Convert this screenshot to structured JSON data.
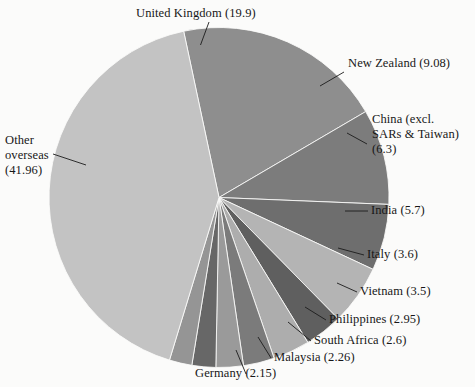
{
  "chart_data": {
    "type": "pie",
    "title": "",
    "subtitle": "",
    "xlabel": "",
    "ylabel": "",
    "legend_position": "callout-labels",
    "grid": false,
    "units": "percent",
    "total": 100.0,
    "start_angle_deg": -12,
    "direction": "clockwise",
    "categories": [
      "United Kingdom",
      "New Zealand",
      "China (excl. SARs & Taiwan)",
      "India",
      "Italy",
      "Vietnam",
      "Philippines",
      "South Africa",
      "Malaysia",
      "Germany",
      "Other overseas"
    ],
    "values": [
      19.9,
      9.08,
      6.3,
      5.7,
      3.6,
      3.5,
      2.95,
      2.6,
      2.26,
      2.15,
      41.96
    ],
    "colors": [
      "#8e8e8e",
      "#7c7c7c",
      "#6e6e6e",
      "#b4b4b4",
      "#5f5f5f",
      "#adadad",
      "#7b7b7b",
      "#9a9a9a",
      "#676767",
      "#959595",
      "#c3c3c3"
    ],
    "slices": [
      {
        "label": "United Kingdom",
        "value": 19.9,
        "display": "United Kingdom (19.9)",
        "color": "#8e8e8e"
      },
      {
        "label": "New Zealand",
        "value": 9.08,
        "display": "New Zealand (9.08)",
        "color": "#7c7c7c"
      },
      {
        "label": "China (excl. SARs & Taiwan)",
        "value": 6.3,
        "display": "China (excl. SARs & Taiwan) (6.3)",
        "color": "#6e6e6e"
      },
      {
        "label": "India",
        "value": 5.7,
        "display": "India (5.7)",
        "color": "#b4b4b4"
      },
      {
        "label": "Italy",
        "value": 3.6,
        "display": "Italy (3.6)",
        "color": "#5f5f5f"
      },
      {
        "label": "Vietnam",
        "value": 3.5,
        "display": "Vietnam (3.5)",
        "color": "#adadad"
      },
      {
        "label": "Philippines",
        "value": 2.95,
        "display": "Philippines (2.95)",
        "color": "#7b7b7b"
      },
      {
        "label": "South Africa",
        "value": 2.6,
        "display": "South Africa (2.6)",
        "color": "#9a9a9a"
      },
      {
        "label": "Malaysia",
        "value": 2.26,
        "display": "Malaysia (2.26)",
        "color": "#676767"
      },
      {
        "label": "Germany",
        "value": 2.15,
        "display": "Germany (2.15)",
        "color": "#959595"
      },
      {
        "label": "Other overseas",
        "value": 41.96,
        "display": "Other overseas (41.96)",
        "color": "#c3c3c3"
      }
    ]
  },
  "labels": {
    "united_kingdom": "United Kingdom (19.9)",
    "new_zealand": "New Zealand (9.08)",
    "china_line1": "China (excl.",
    "china_line2": "SARs & Taiwan)",
    "china_line3": "(6.3)",
    "india": "India (5.7)",
    "italy": "Italy (3.6)",
    "vietnam": "Vietnam (3.5)",
    "philippines": "Philippines (2.95)",
    "south_africa": "South Africa (2.6)",
    "malaysia": "Malaysia (2.26)",
    "germany": "Germany (2.15)",
    "other_line1": "Other",
    "other_line2": "overseas",
    "other_line3": "(41.96)"
  }
}
